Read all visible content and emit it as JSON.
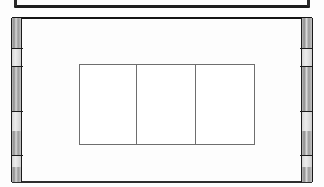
{
  "page": {
    "background_color": "#fdfdfd",
    "width": 324,
    "height": 187
  },
  "frame": {
    "border_color": "#141414",
    "preceding_rule_color": "#1d1d1d"
  },
  "edge_bands": {
    "fill_color": "#9a9a9a",
    "rule_color": "#1a1a1a",
    "left": {
      "segment_breaks": [
        48,
        93,
        137
      ]
    },
    "right": {
      "segment_breaks": [
        48,
        93,
        137
      ]
    }
  },
  "table": {
    "border_color": "#6e6e6e",
    "background_color": "#ffffff",
    "rows": 1,
    "columns": 3,
    "cells": [
      [
        "",
        "",
        ""
      ]
    ]
  }
}
